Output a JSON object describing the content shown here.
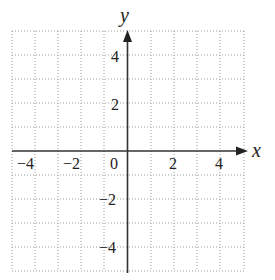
{
  "diagram": {
    "type": "coordinate-grid",
    "x_axis": {
      "label": "x",
      "min": -5,
      "max": 5,
      "tick_labels": [
        "-4",
        "-2",
        "2",
        "4"
      ],
      "origin_label": "0"
    },
    "y_axis": {
      "label": "y",
      "min": -5,
      "max": 5,
      "tick_labels": [
        "4",
        "2",
        "-2",
        "-4"
      ]
    },
    "grid_step": 1,
    "colors": {
      "grid": "#9a9a9a",
      "axis": "#333333",
      "text": "#222222"
    }
  },
  "labels": {
    "x": "x",
    "y": "y",
    "xm4": "−4",
    "xm2": "−2",
    "x0": "0",
    "x2": "2",
    "x4": "4",
    "y4": "4",
    "y2": "2",
    "ym2": "−2",
    "ym4": "−4"
  }
}
